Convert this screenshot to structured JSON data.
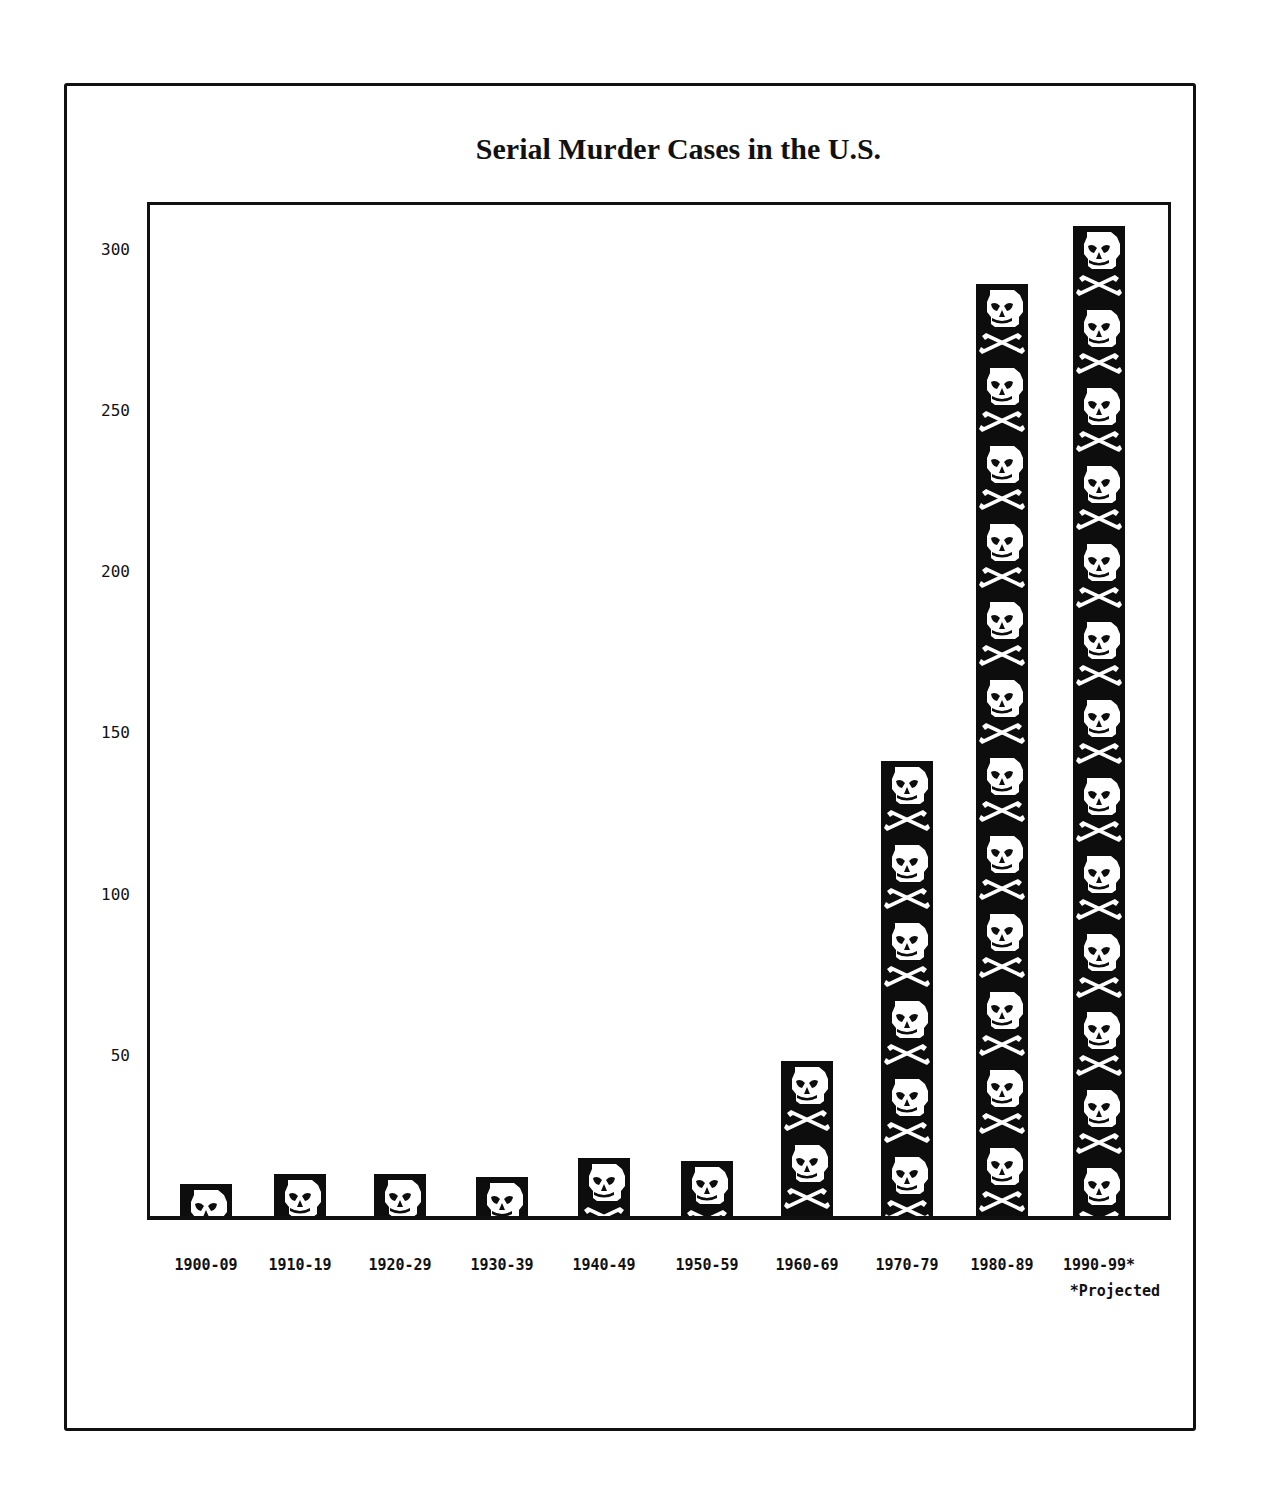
{
  "chart_data": {
    "type": "bar",
    "title": "Serial Murder Cases in the U.S.",
    "xlabel": "",
    "ylabel": "",
    "ylim": [
      0,
      315
    ],
    "yticks": [
      50,
      100,
      150,
      200,
      250,
      300
    ],
    "grid": false,
    "legend": null,
    "categories": [
      "1900-09",
      "1910-19",
      "1920-29",
      "1930-39",
      "1940-49",
      "1950-59",
      "1960-69",
      "1970-79",
      "1980-89",
      "1990-99*"
    ],
    "values": [
      10,
      13,
      13,
      12,
      18,
      17,
      48,
      141,
      289,
      307
    ],
    "bar_fill": "skull-and-crossbones pictogram",
    "annotations": [
      "*Projected"
    ]
  },
  "labels": {
    "title": "Serial Murder Cases in the U.S.",
    "yticks": [
      "50",
      "100",
      "150",
      "200",
      "250",
      "300"
    ],
    "categories": [
      "1900-09",
      "1910-19",
      "1920-29",
      "1930-39",
      "1940-49",
      "1950-59",
      "1960-69",
      "1970-79",
      "1980-89",
      "1990-99*"
    ],
    "footnote": "*Projected"
  },
  "colors": {
    "bar": "#0d0d0d",
    "skull": "#ffffff",
    "axis": "#111111",
    "background": "#ffffff"
  }
}
